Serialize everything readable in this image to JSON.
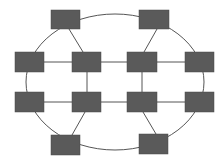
{
  "diagram": {
    "type": "network-topology",
    "colors": {
      "background": "#ffffff",
      "node_fill": "#5a5a5a",
      "node_stroke": "#4a4a4a",
      "edge": "#555555"
    },
    "ring": {
      "cx": 115,
      "cy": 82,
      "rx": 89,
      "ry": 68
    },
    "nodes": [
      {
        "id": "top-left",
        "x": 51,
        "y": 10,
        "w": 29,
        "h": 19
      },
      {
        "id": "top-right",
        "x": 139,
        "y": 10,
        "w": 30,
        "h": 19
      },
      {
        "id": "r1-outer-left",
        "x": 15,
        "y": 52,
        "w": 29,
        "h": 20
      },
      {
        "id": "r1-inner-left",
        "x": 72,
        "y": 52,
        "w": 29,
        "h": 20
      },
      {
        "id": "r1-inner-right",
        "x": 127,
        "y": 52,
        "w": 30,
        "h": 20
      },
      {
        "id": "r1-outer-right",
        "x": 185,
        "y": 52,
        "w": 29,
        "h": 20
      },
      {
        "id": "r2-outer-left",
        "x": 15,
        "y": 92,
        "w": 29,
        "h": 20
      },
      {
        "id": "r2-inner-left",
        "x": 72,
        "y": 92,
        "w": 29,
        "h": 20
      },
      {
        "id": "r2-inner-right",
        "x": 127,
        "y": 92,
        "w": 30,
        "h": 20
      },
      {
        "id": "r2-outer-right",
        "x": 185,
        "y": 92,
        "w": 29,
        "h": 20
      },
      {
        "id": "bottom-left",
        "x": 51,
        "y": 135,
        "w": 29,
        "h": 20
      },
      {
        "id": "bottom-right",
        "x": 139,
        "y": 134,
        "w": 29,
        "h": 20
      }
    ],
    "edges": [
      {
        "from": "top-left",
        "to": "r1-inner-left",
        "x1": 69,
        "y1": 29,
        "x2": 83,
        "y2": 52
      },
      {
        "from": "top-right",
        "to": "r1-inner-right",
        "x1": 157,
        "y1": 29,
        "x2": 144,
        "y2": 52
      },
      {
        "from": "r1-outer-left",
        "to": "r1-inner-left",
        "x1": 44,
        "y1": 62,
        "x2": 72,
        "y2": 62
      },
      {
        "from": "r1-inner-left",
        "to": "r1-inner-right",
        "x1": 101,
        "y1": 62,
        "x2": 127,
        "y2": 62
      },
      {
        "from": "r1-inner-right",
        "to": "r1-outer-right",
        "x1": 157,
        "y1": 62,
        "x2": 185,
        "y2": 62
      },
      {
        "from": "r1-inner-left",
        "to": "r2-inner-left",
        "x1": 87,
        "y1": 72,
        "x2": 87,
        "y2": 92
      },
      {
        "from": "r1-inner-right",
        "to": "r2-inner-right",
        "x1": 142,
        "y1": 72,
        "x2": 142,
        "y2": 92
      },
      {
        "from": "r2-outer-left",
        "to": "r2-inner-left",
        "x1": 44,
        "y1": 102,
        "x2": 72,
        "y2": 102
      },
      {
        "from": "r2-inner-left",
        "to": "r2-inner-right",
        "x1": 101,
        "y1": 102,
        "x2": 127,
        "y2": 102
      },
      {
        "from": "r2-inner-right",
        "to": "r2-outer-right",
        "x1": 157,
        "y1": 102,
        "x2": 185,
        "y2": 102
      },
      {
        "from": "r2-inner-left",
        "to": "bottom-left",
        "x1": 85,
        "y1": 112,
        "x2": 72,
        "y2": 135
      },
      {
        "from": "r2-inner-right",
        "to": "bottom-right",
        "x1": 143,
        "y1": 112,
        "x2": 156,
        "y2": 134
      }
    ]
  }
}
